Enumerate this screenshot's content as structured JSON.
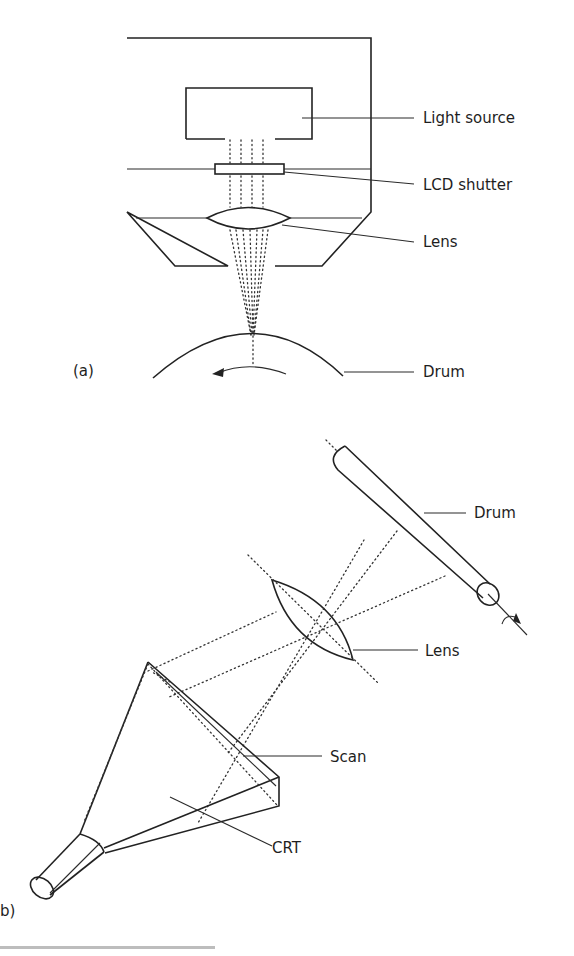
{
  "figure": {
    "panel_a": {
      "label": "(a)",
      "components": {
        "light_source": "Light source",
        "lcd_shutter": "LCD shutter",
        "lens": "Lens",
        "drum": "Drum"
      }
    },
    "panel_b": {
      "label": "b)",
      "components": {
        "drum": "Drum",
        "lens": "Lens",
        "scan": "Scan",
        "crt": "CRT"
      }
    }
  },
  "colors": {
    "ink": "#222222",
    "background": "#ffffff"
  }
}
